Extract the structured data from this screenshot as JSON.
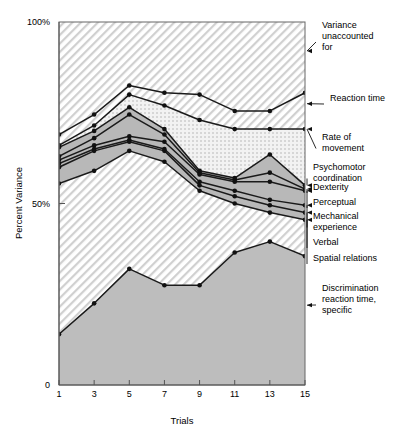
{
  "chart_data": {
    "type": "area",
    "title": "",
    "xlabel": "Trials",
    "ylabel": "Percent Variance",
    "x": [
      1,
      3,
      5,
      7,
      9,
      11,
      13,
      15
    ],
    "xticklabels": [
      "1",
      "3",
      "5",
      "7",
      "9",
      "11",
      "13",
      "15"
    ],
    "xlim": [
      1,
      15
    ],
    "ylim": [
      0,
      100
    ],
    "yticks": [
      0,
      50,
      100
    ],
    "yticklabels": [
      "0",
      "50%",
      "100%"
    ],
    "grid": false,
    "legend_position": "right-inline-annotations",
    "note": "Cumulative stacked variance bands; each series value is the cumulative percent variance at the top of that band.",
    "series": [
      {
        "name": "Reaction time",
        "label": "Reaction time",
        "fill": "hatch-diagonal-above",
        "values": [
          69.0,
          74.5,
          82.5,
          80.5,
          80.0,
          75.5,
          75.5,
          80.5
        ]
      },
      {
        "name": "Rate of movement",
        "label": "Rate of movement",
        "fill": "stipple-dots",
        "values": [
          66.0,
          71.5,
          80.0,
          77.0,
          73.0,
          70.5,
          70.5,
          70.5
        ]
      },
      {
        "name": "Psychomotor coordination",
        "label": "Psychomotor coordination",
        "fill": "gray-solid",
        "values": [
          65.5,
          70.0,
          76.5,
          70.5,
          59.0,
          57.0,
          63.5,
          55.0
        ]
      },
      {
        "name": "Dexterity",
        "label": "Dexterity",
        "fill": "gray-solid",
        "values": [
          63.0,
          68.0,
          74.5,
          69.0,
          58.5,
          56.5,
          58.5,
          54.0
        ]
      },
      {
        "name": "Perceptual",
        "label": "Perceptual",
        "fill": "gray-solid",
        "values": [
          62.0,
          66.0,
          68.5,
          67.0,
          58.0,
          56.0,
          56.0,
          53.5
        ]
      },
      {
        "name": "Mechanical experience",
        "label": "Mechanical experience",
        "fill": "gray-solid",
        "values": [
          61.0,
          65.0,
          67.5,
          65.0,
          56.0,
          53.5,
          51.0,
          49.5
        ]
      },
      {
        "name": "Verbal",
        "label": "Verbal",
        "fill": "gray-solid",
        "values": [
          60.0,
          64.5,
          67.0,
          64.5,
          55.0,
          52.0,
          49.5,
          47.5
        ]
      },
      {
        "name": "Spatial relations",
        "label": "Spatial relations",
        "fill": "hatch-diagonal-below",
        "values": [
          55.5,
          59.0,
          64.5,
          61.5,
          53.5,
          50.0,
          47.5,
          45.5
        ]
      },
      {
        "name": "Discrimination reaction time, specific",
        "label": "Discrimination reaction time, specific",
        "fill": "gray-solid-bottom",
        "values": [
          14.0,
          22.5,
          32.0,
          27.5,
          27.5,
          36.5,
          39.5,
          35.5
        ]
      }
    ],
    "annotations": [
      {
        "id": "variance-unaccounted-for",
        "lines": [
          "Variance",
          "unaccounted",
          "for"
        ],
        "text": "Variance unaccounted for",
        "degraded_print": true,
        "target_y": 92.0,
        "label_x": 322,
        "label_y": 28
      },
      {
        "id": "reaction-time",
        "lines": [
          "Reaction time"
        ],
        "text": "Reaction time",
        "target_y": 77.5,
        "label_x": 330,
        "label_y": 101
      },
      {
        "id": "rate-of-movement",
        "lines": [
          "Rate of",
          "movement"
        ],
        "text": "Rate of movement",
        "target_y": 70.5,
        "label_x": 322,
        "label_y": 140
      },
      {
        "id": "psychomotor-coordination",
        "lines": [
          "Psychomotor",
          "coordination"
        ],
        "text": "Psychomotor coordination",
        "target_y": 55.0,
        "label_x": 313,
        "label_y": 170
      },
      {
        "id": "dexterity",
        "lines": [
          "Dexterity"
        ],
        "text": "Dexterity",
        "target_y": 54.0,
        "label_x": 313,
        "label_y": 190
      },
      {
        "id": "perceptual",
        "lines": [
          "Perceptual"
        ],
        "text": "Perceptual",
        "target_y": 53.5,
        "label_x": 313,
        "label_y": 205
      },
      {
        "id": "mechanical-experience",
        "lines": [
          "Mechanical",
          "experience"
        ],
        "text": "Mechanical experience",
        "target_y": 49.5,
        "label_x": 313,
        "label_y": 219
      },
      {
        "id": "verbal",
        "lines": [
          "Verbal"
        ],
        "text": "Verbal",
        "target_y": 47.5,
        "label_x": 313,
        "label_y": 245
      },
      {
        "id": "spatial-relations",
        "lines": [
          "Spatial relations"
        ],
        "text": "Spatial relations",
        "target_y": 45.5,
        "label_x": 313,
        "label_y": 261
      },
      {
        "id": "discrimination-reaction-time",
        "lines": [
          "Discrimination",
          "reaction time,",
          "specific"
        ],
        "text": "Discrimination reaction time, specific",
        "target_y": 22.0,
        "label_x": 322,
        "label_y": 291
      }
    ]
  },
  "colors": {
    "line": "#1a1a1a",
    "marker": "#111111",
    "axis": "#555555",
    "band_gray": "#b8b8b8",
    "band_gray_bottom": "#bdbdbd",
    "hatch_line": "#cfcfcf",
    "stipple_dot": "#d8d8d8",
    "text": "#000000",
    "background": "#ffffff"
  },
  "axis": {
    "y_title": "Percent Variance",
    "x_title": "Trials",
    "y_top_label": "100%",
    "y_mid_label": "50%",
    "y_zero_label": "0"
  }
}
